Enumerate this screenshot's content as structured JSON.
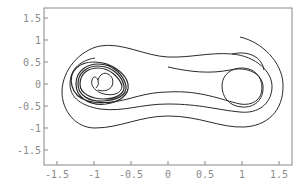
{
  "chart_data": {
    "type": "line",
    "title": "",
    "xlabel": "",
    "ylabel": "",
    "xlim": [
      -1.65,
      1.65
    ],
    "ylim": [
      -1.85,
      1.7
    ],
    "grid": false,
    "legend": null,
    "x_ticks": [
      "-1.5",
      "-1",
      "-0.5",
      "0",
      "0.5",
      "1",
      "1.5"
    ],
    "x_tick_values": [
      -1.5,
      -1,
      -0.5,
      0,
      0.5,
      1,
      1.5
    ],
    "y_ticks": [
      "1.5",
      "1",
      "0.5",
      "0",
      "-0.5",
      "-1",
      "-1.5"
    ],
    "y_tick_values": [
      1.5,
      1,
      0.5,
      0,
      -0.5,
      -1,
      -1.5
    ],
    "series": [
      {
        "name": "phase trajectory (x, dx/dt)",
        "description": "Duffing-type oscillator phase portrait; starts near (0.97, 1.07), spirals through large double-well loops, settles into tight limit cycle around left well (-1, 0)",
        "approx_points": [
          [
            0.97,
            1.07
          ],
          [
            1.3,
            0.8
          ],
          [
            1.55,
            0.1
          ],
          [
            1.4,
            -0.6
          ],
          [
            1.0,
            -0.95
          ],
          [
            0.5,
            -0.8
          ],
          [
            0,
            -0.75
          ],
          [
            -0.5,
            -0.95
          ],
          [
            -1.1,
            -0.9
          ],
          [
            -1.45,
            -0.3
          ],
          [
            -1.4,
            0.4
          ],
          [
            -1.0,
            0.8
          ],
          [
            -0.5,
            0.75
          ],
          [
            0,
            0.55
          ],
          [
            0.5,
            0.6
          ],
          [
            1.0,
            0.6
          ],
          [
            1.45,
            0.3
          ],
          [
            1.45,
            -0.3
          ],
          [
            1.0,
            -0.6
          ],
          [
            0.5,
            -0.5
          ],
          [
            0,
            -0.4
          ],
          [
            -0.5,
            -0.4
          ],
          [
            -1.05,
            -0.55
          ],
          [
            -1.3,
            -0.1
          ],
          [
            -1.2,
            0.3
          ],
          [
            -0.9,
            0.4
          ],
          [
            -0.6,
            0.2
          ],
          [
            -0.55,
            -0.1
          ],
          [
            -0.8,
            -0.35
          ],
          [
            -1.2,
            -0.35
          ],
          [
            -1.3,
            0
          ],
          [
            -1.1,
            0.35
          ],
          [
            -0.75,
            0.3
          ],
          [
            -0.6,
            0
          ],
          [
            -0.8,
            -0.3
          ]
        ]
      }
    ]
  },
  "plot": {
    "frame_color": "#888888",
    "line_color": "#2a2a2a"
  }
}
